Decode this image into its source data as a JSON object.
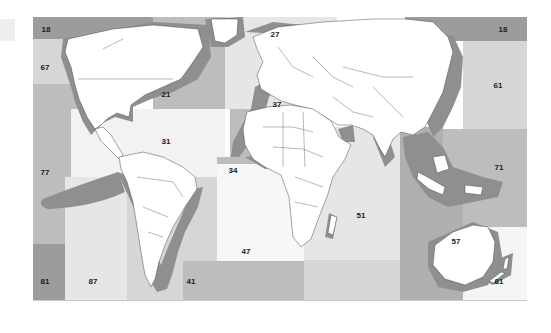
{
  "map": {
    "title": "FAO Major Fishing Areas",
    "colors": {
      "dark": "#9c9c9c",
      "medium": "#bdbdbd",
      "light": "#d6d6d6",
      "pale": "#e6e6e6",
      "verypale": "#f2f2f2",
      "land": "#ffffff",
      "shelf": "#8f8f8f",
      "border": "#555555"
    },
    "areas": [
      {
        "code": "18",
        "x": 13,
        "y": 12
      },
      {
        "code": "18",
        "x": 470,
        "y": 12
      },
      {
        "code": "67",
        "x": 12,
        "y": 50
      },
      {
        "code": "21",
        "x": 133,
        "y": 77
      },
      {
        "code": "27",
        "x": 242,
        "y": 17
      },
      {
        "code": "37",
        "x": 244,
        "y": 87
      },
      {
        "code": "61",
        "x": 465,
        "y": 68
      },
      {
        "code": "31",
        "x": 133,
        "y": 124
      },
      {
        "code": "34",
        "x": 200,
        "y": 153
      },
      {
        "code": "77",
        "x": 12,
        "y": 155
      },
      {
        "code": "71",
        "x": 466,
        "y": 150
      },
      {
        "code": "51",
        "x": 328,
        "y": 198
      },
      {
        "code": "57",
        "x": 423,
        "y": 224
      },
      {
        "code": "47",
        "x": 213,
        "y": 234
      },
      {
        "code": "81",
        "x": 12,
        "y": 264
      },
      {
        "code": "87",
        "x": 60,
        "y": 264
      },
      {
        "code": "41",
        "x": 158,
        "y": 264
      },
      {
        "code": "81",
        "x": 466,
        "y": 264
      },
      {
        "code": "48",
        "x": 213,
        "y": 289
      },
      {
        "code": "58",
        "x": 325,
        "y": 289
      }
    ]
  }
}
